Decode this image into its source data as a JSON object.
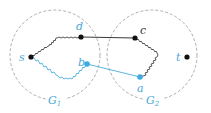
{
  "colors": {
    "black": "#111111",
    "blue": "#3fa9e0",
    "dashed": "#888888",
    "label_blue": "#4aa8d8"
  },
  "graphs": [
    {
      "id": "G1",
      "label": "G",
      "sub": "1"
    },
    {
      "id": "G2",
      "label": "G",
      "sub": "2"
    }
  ],
  "vertices": {
    "s": {
      "label": "s",
      "color": "black"
    },
    "d": {
      "label": "d",
      "color": "black"
    },
    "c": {
      "label": "c",
      "color": "black"
    },
    "t": {
      "label": "t",
      "color": "black"
    },
    "b": {
      "label": "b",
      "color": "blue"
    },
    "a": {
      "label": "a",
      "color": "blue"
    }
  }
}
